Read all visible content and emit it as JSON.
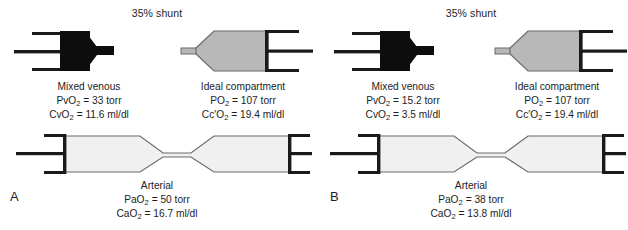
{
  "figure": {
    "background": "#ffffff",
    "stroke_color": "#1a1a1a",
    "venous_fill": "#0d0d0d",
    "ideal_fill": "#b8b8b8",
    "arterial_fill": "#f0f0f0"
  },
  "panels": [
    {
      "letter": "A",
      "shunt_label": "35% shunt",
      "compartments": {
        "venous": {
          "title": "Mixed venous",
          "pressure_symbol": "Pv",
          "pressure_sub": "2",
          "pressure_value": "= 33 torr",
          "content_symbol": "Cv",
          "content_sub": "2",
          "content_value": "= 11.6 ml/dl"
        },
        "ideal": {
          "title": "Ideal compartment",
          "pressure_symbol": "P",
          "pressure_sub": "2",
          "pressure_value": "= 107 torr",
          "content_symbol": "Cc′",
          "content_sub": "2",
          "content_value": "= 19.4 ml/dl"
        },
        "arterial": {
          "title": "Arterial",
          "pressure_symbol": "Pa",
          "pressure_sub": "2",
          "pressure_value": "= 50 torr",
          "content_symbol": "Ca",
          "content_sub": "2",
          "content_value": "= 16.7 ml/dl"
        }
      }
    },
    {
      "letter": "B",
      "shunt_label": "35% shunt",
      "compartments": {
        "venous": {
          "title": "Mixed venous",
          "pressure_symbol": "Pv",
          "pressure_sub": "2",
          "pressure_value": "= 15.2 torr",
          "content_symbol": "Cv",
          "content_sub": "2",
          "content_value": "= 3.5 ml/dl"
        },
        "ideal": {
          "title": "Ideal compartment",
          "pressure_symbol": "P",
          "pressure_sub": "2",
          "pressure_value": "= 107 torr",
          "content_symbol": "Cc′",
          "content_sub": "2",
          "content_value": "= 19.4 ml/dl"
        },
        "arterial": {
          "title": "Arterial",
          "pressure_symbol": "Pa",
          "pressure_sub": "2",
          "pressure_value": "= 38 torr",
          "content_symbol": "Ca",
          "content_sub": "2",
          "content_value": "= 13.8 ml/dl"
        }
      }
    }
  ],
  "oxygen_symbol": "O"
}
